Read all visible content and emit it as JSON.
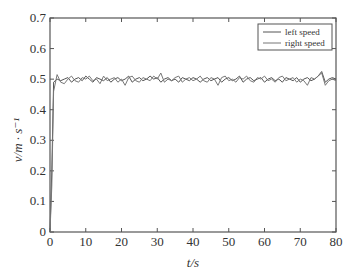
{
  "chart_data": {
    "type": "line",
    "title": "",
    "xlabel": "t/s",
    "ylabel": "v/m · s⁻¹",
    "xlim": [
      0,
      80
    ],
    "ylim": [
      0,
      0.7
    ],
    "xticks": [
      0,
      10,
      20,
      30,
      40,
      50,
      60,
      70,
      80
    ],
    "yticks": [
      0,
      0.1,
      0.2,
      0.3,
      0.4,
      0.5,
      0.6,
      0.7
    ],
    "ytick_labels": [
      "0",
      "0.1",
      "0.2",
      "0.3",
      "0.4",
      "0.5",
      "0.6",
      "0.7"
    ],
    "grid": false,
    "legend_position": "upper right",
    "series": [
      {
        "name": "left speed",
        "color": "#555555",
        "x": [
          0,
          0.5,
          1,
          2,
          3,
          4,
          5,
          6,
          7,
          8,
          9,
          10,
          11,
          12,
          13,
          14,
          15,
          16,
          17,
          18,
          19,
          20,
          21,
          22,
          23,
          24,
          25,
          26,
          27,
          28,
          29,
          30,
          31,
          32,
          33,
          34,
          35,
          36,
          37,
          38,
          39,
          40,
          41,
          42,
          43,
          44,
          45,
          46,
          47,
          48,
          49,
          50,
          51,
          52,
          53,
          54,
          55,
          56,
          57,
          58,
          59,
          60,
          61,
          62,
          63,
          64,
          65,
          66,
          67,
          68,
          69,
          70,
          71,
          72,
          73,
          74,
          75,
          76,
          77,
          78,
          79,
          80
        ],
        "values": [
          0.0,
          0.2,
          0.49,
          0.5,
          0.495,
          0.5,
          0.505,
          0.49,
          0.5,
          0.505,
          0.495,
          0.51,
          0.5,
          0.49,
          0.505,
          0.5,
          0.495,
          0.505,
          0.49,
          0.5,
          0.505,
          0.495,
          0.5,
          0.51,
          0.49,
          0.5,
          0.505,
          0.495,
          0.5,
          0.51,
          0.5,
          0.505,
          0.49,
          0.5,
          0.505,
          0.495,
          0.5,
          0.49,
          0.505,
          0.5,
          0.495,
          0.505,
          0.5,
          0.49,
          0.5,
          0.505,
          0.495,
          0.5,
          0.505,
          0.49,
          0.5,
          0.505,
          0.495,
          0.5,
          0.51,
          0.49,
          0.5,
          0.505,
          0.495,
          0.5,
          0.505,
          0.49,
          0.5,
          0.505,
          0.495,
          0.5,
          0.49,
          0.505,
          0.5,
          0.495,
          0.505,
          0.49,
          0.5,
          0.505,
          0.495,
          0.5,
          0.51,
          0.525,
          0.49,
          0.5,
          0.505,
          0.5
        ]
      },
      {
        "name": "right speed",
        "color": "#777777",
        "x": [
          0,
          0.5,
          1,
          2,
          3,
          4,
          5,
          6,
          7,
          8,
          9,
          10,
          11,
          12,
          13,
          14,
          15,
          16,
          17,
          18,
          19,
          20,
          21,
          22,
          23,
          24,
          25,
          26,
          27,
          28,
          29,
          30,
          31,
          32,
          33,
          34,
          35,
          36,
          37,
          38,
          39,
          40,
          41,
          42,
          43,
          44,
          45,
          46,
          47,
          48,
          49,
          50,
          51,
          52,
          53,
          54,
          55,
          56,
          57,
          58,
          59,
          60,
          61,
          62,
          63,
          64,
          65,
          66,
          67,
          68,
          69,
          70,
          71,
          72,
          73,
          74,
          75,
          76,
          77,
          78,
          79,
          80
        ],
        "values": [
          0.0,
          0.15,
          0.46,
          0.515,
          0.49,
          0.485,
          0.5,
          0.51,
          0.495,
          0.49,
          0.505,
          0.5,
          0.51,
          0.495,
          0.5,
          0.485,
          0.51,
          0.495,
          0.5,
          0.505,
          0.49,
          0.5,
          0.48,
          0.505,
          0.51,
          0.495,
          0.49,
          0.505,
          0.5,
          0.495,
          0.51,
          0.5,
          0.52,
          0.49,
          0.5,
          0.495,
          0.505,
          0.51,
          0.49,
          0.5,
          0.505,
          0.495,
          0.5,
          0.51,
          0.495,
          0.49,
          0.505,
          0.5,
          0.48,
          0.505,
          0.51,
          0.495,
          0.5,
          0.49,
          0.505,
          0.5,
          0.51,
          0.495,
          0.49,
          0.505,
          0.5,
          0.51,
          0.495,
          0.5,
          0.49,
          0.505,
          0.51,
          0.495,
          0.5,
          0.505,
          0.49,
          0.5,
          0.495,
          0.48,
          0.505,
          0.5,
          0.51,
          0.52,
          0.48,
          0.495,
          0.5,
          0.495
        ]
      }
    ]
  },
  "axes": {
    "xlabel": "t/s",
    "ylabel": "v/m · s⁻¹"
  },
  "legend": {
    "items": [
      "left speed",
      "right speed"
    ]
  }
}
